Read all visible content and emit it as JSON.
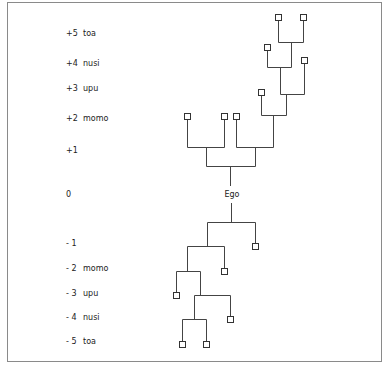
{
  "diagram": {
    "type": "kinship-generation-tree",
    "ego_label": "Ego",
    "line_color": "#444444",
    "generations": [
      {
        "num": "+5",
        "term": "toa",
        "y": 34
      },
      {
        "num": "+4",
        "term": "nusi",
        "y": 64
      },
      {
        "num": "+3",
        "term": "upu",
        "y": 89
      },
      {
        "num": "+2",
        "term": "momo",
        "y": 119
      },
      {
        "num": "+1",
        "term": "",
        "y": 151
      },
      {
        "num": "0",
        "term": "",
        "y": 195
      },
      {
        "num": "- 1",
        "term": "",
        "y": 244
      },
      {
        "num": "- 2",
        "term": "momo",
        "y": 269
      },
      {
        "num": "- 3",
        "term": "upu",
        "y": 294
      },
      {
        "num": "- 4",
        "term": "nusi",
        "y": 318
      },
      {
        "num": "- 5",
        "term": "toa",
        "y": 342
      }
    ],
    "nodes": [
      {
        "id": "a5-1",
        "x": 278,
        "y": 17
      },
      {
        "id": "a5-2",
        "x": 303,
        "y": 17
      },
      {
        "id": "a4-1",
        "x": 267,
        "y": 47
      },
      {
        "id": "a4-2",
        "x": 304,
        "y": 60
      },
      {
        "id": "a3-1",
        "x": 261,
        "y": 92
      },
      {
        "id": "a2-1",
        "x": 187,
        "y": 116
      },
      {
        "id": "a2-2",
        "x": 224,
        "y": 116
      },
      {
        "id": "a2-3",
        "x": 236,
        "y": 116
      },
      {
        "id": "d1-1",
        "x": 255,
        "y": 246
      },
      {
        "id": "d2-1",
        "x": 224,
        "y": 271
      },
      {
        "id": "d3-1",
        "x": 176,
        "y": 295
      },
      {
        "id": "d4-1",
        "x": 230,
        "y": 319
      },
      {
        "id": "d5-1",
        "x": 182,
        "y": 344
      },
      {
        "id": "d5-2",
        "x": 206,
        "y": 344
      }
    ],
    "ego": {
      "x": 232,
      "y": 195
    }
  }
}
